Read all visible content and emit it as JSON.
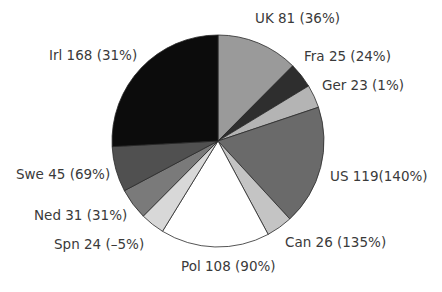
{
  "chart_data": {
    "type": "pie",
    "title": "",
    "total": 650,
    "start_angle_deg": 0,
    "direction": "clockwise",
    "slices": [
      {
        "name": "UK",
        "value": 81,
        "change": "36%",
        "label": "UK 81 (36%)",
        "color": "#9a9a9a"
      },
      {
        "name": "Fra",
        "value": 25,
        "change": "24%",
        "label": "Fra 25 (24%)",
        "color": "#2e2e2e"
      },
      {
        "name": "Ger",
        "value": 23,
        "change": "1%",
        "label": "Ger 23 (1%)",
        "color": "#b4b4b4"
      },
      {
        "name": "US",
        "value": 119,
        "change": "140%",
        "label": "US 119(140%)",
        "color": "#6a6a6a"
      },
      {
        "name": "Can",
        "value": 26,
        "change": "135%",
        "label": "Can 26 (135%)",
        "color": "#c4c4c4"
      },
      {
        "name": "Pol",
        "value": 108,
        "change": "90%",
        "label": "Pol 108 (90%)",
        "color": "#ffffff"
      },
      {
        "name": "Spn",
        "value": 24,
        "change": "-5%",
        "label": "Spn 24 (–5%)",
        "color": "#d8d8d8"
      },
      {
        "name": "Ned",
        "value": 31,
        "change": "31%",
        "label": "Ned 31 (31%)",
        "color": "#7a7a7a"
      },
      {
        "name": "Swe",
        "value": 45,
        "change": "69%",
        "label": "Swe 45 (69%)",
        "color": "#505050"
      },
      {
        "name": "Irl",
        "value": 168,
        "change": "31%",
        "label": "Irl 168 (31%)",
        "color": "#0c0c0c"
      }
    ],
    "legend": "none",
    "labels_position": "outside"
  },
  "labels": {
    "uk": "UK 81 (36%)",
    "fra": "Fra 25 (24%)",
    "ger": "Ger 23 (1%)",
    "us": "US 119(140%)",
    "can": "Can 26 (135%)",
    "pol": "Pol 108 (90%)",
    "spn": "Spn 24 (–5%)",
    "ned": "Ned 31 (31%)",
    "swe": "Swe 45 (69%)",
    "irl": "Irl 168 (31%)"
  }
}
